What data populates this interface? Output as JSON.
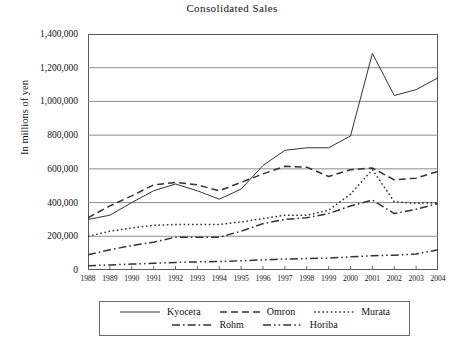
{
  "chart_data": {
    "type": "line",
    "title": "Consolidated Sales",
    "xlabel": "",
    "ylabel": "In millions of yen",
    "grid": true,
    "legend_position": "bottom",
    "ylim": [
      0,
      1400000
    ],
    "ytick_labels": [
      "1,400,000",
      "1,200,000",
      "1,000,000",
      "800,000",
      "600,000",
      "400,000",
      "200,000",
      "0"
    ],
    "ytick_values": [
      1400000,
      1200000,
      1000000,
      800000,
      600000,
      400000,
      200000,
      0
    ],
    "categories": [
      "1988",
      "1989",
      "1990",
      "1991",
      "1992",
      "1993",
      "1994",
      "1995",
      "1996",
      "1997",
      "1998",
      "1999",
      "2000",
      "2001",
      "2002",
      "2003",
      "2004"
    ],
    "series": [
      {
        "name": "Kyocera",
        "style": "solid",
        "values": [
          300000,
          325000,
          400000,
          470000,
          510000,
          470000,
          420000,
          480000,
          620000,
          710000,
          725000,
          725000,
          795000,
          1285000,
          1035000,
          1070000,
          1140000
        ]
      },
      {
        "name": "Omron",
        "style": "dashed",
        "values": [
          310000,
          380000,
          440000,
          505000,
          520000,
          505000,
          470000,
          520000,
          570000,
          615000,
          610000,
          555000,
          595000,
          605000,
          535000,
          545000,
          585000
        ]
      },
      {
        "name": "Murata",
        "style": "dotted",
        "values": [
          200000,
          230000,
          250000,
          265000,
          270000,
          270000,
          270000,
          285000,
          305000,
          325000,
          325000,
          355000,
          450000,
          595000,
          405000,
          395000,
          400000
        ]
      },
      {
        "name": "Rohm",
        "style": "dashdot",
        "values": [
          90000,
          120000,
          145000,
          165000,
          195000,
          195000,
          195000,
          230000,
          275000,
          300000,
          310000,
          335000,
          380000,
          415000,
          335000,
          360000,
          395000
        ]
      },
      {
        "name": "Horiba",
        "style": "dashdotdot",
        "values": [
          25000,
          30000,
          35000,
          40000,
          45000,
          48000,
          50000,
          55000,
          60000,
          65000,
          68000,
          70000,
          78000,
          85000,
          88000,
          95000,
          120000
        ]
      }
    ]
  },
  "legend": {
    "rows": [
      [
        {
          "label": "Kyocera",
          "style": "solid"
        },
        {
          "label": "Omron",
          "style": "dashed"
        },
        {
          "label": "Murata",
          "style": "dotted"
        }
      ],
      [
        {
          "label": "Rohm",
          "style": "dashdot"
        },
        {
          "label": "Horiba",
          "style": "dashdotdot"
        }
      ]
    ]
  },
  "colors": {
    "line": "#333333",
    "grid": "#808080",
    "frame": "#5a5a5a",
    "text": "#111111",
    "background": "#ffffff"
  }
}
